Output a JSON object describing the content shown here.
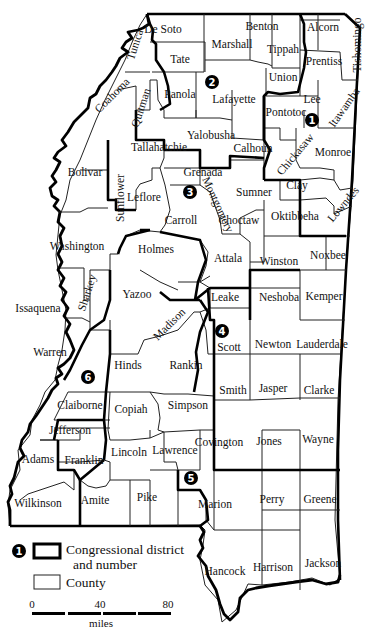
{
  "map": {
    "state": "Mississippi",
    "counties": [
      {
        "name": "De Soto",
        "x": 163,
        "y": 30
      },
      {
        "name": "Tunica",
        "x": 136,
        "y": 45,
        "rotate": -72
      },
      {
        "name": "Tate",
        "x": 180,
        "y": 60
      },
      {
        "name": "Marshall",
        "x": 232,
        "y": 45
      },
      {
        "name": "Benton",
        "x": 262,
        "y": 27
      },
      {
        "name": "Tippah",
        "x": 283,
        "y": 50
      },
      {
        "name": "Alcorn",
        "x": 323,
        "y": 28
      },
      {
        "name": "Tishomingo",
        "x": 358,
        "y": 45,
        "rotate": -90
      },
      {
        "name": "Prentiss",
        "x": 324,
        "y": 62
      },
      {
        "name": "Union",
        "x": 283,
        "y": 78
      },
      {
        "name": "Coahoma",
        "x": 113,
        "y": 96,
        "rotate": -45
      },
      {
        "name": "Quitman",
        "x": 142,
        "y": 108,
        "rotate": -72
      },
      {
        "name": "Panola",
        "x": 180,
        "y": 95
      },
      {
        "name": "Lafayette",
        "x": 234,
        "y": 100
      },
      {
        "name": "Pontotoc",
        "x": 286,
        "y": 113
      },
      {
        "name": "Lee",
        "x": 312,
        "y": 100
      },
      {
        "name": "Itawamba",
        "x": 345,
        "y": 108,
        "rotate": -55
      },
      {
        "name": "Tallahatchie",
        "x": 159,
        "y": 148
      },
      {
        "name": "Yalobusha",
        "x": 211,
        "y": 136
      },
      {
        "name": "Calhoun",
        "x": 253,
        "y": 149
      },
      {
        "name": "Chickasaw",
        "x": 296,
        "y": 155,
        "rotate": -50
      },
      {
        "name": "Monroe",
        "x": 333,
        "y": 153
      },
      {
        "name": "Bolivar",
        "x": 85,
        "y": 173
      },
      {
        "name": "Sunflower",
        "x": 121,
        "y": 198,
        "rotate": -90
      },
      {
        "name": "Leflore",
        "x": 144,
        "y": 198
      },
      {
        "name": "Grenada",
        "x": 203,
        "y": 173
      },
      {
        "name": "Carroll",
        "x": 181,
        "y": 221
      },
      {
        "name": "Montgomery",
        "x": 217,
        "y": 205,
        "rotate": 65
      },
      {
        "name": "Sumner",
        "x": 254,
        "y": 193
      },
      {
        "name": "Clay",
        "x": 297,
        "y": 186
      },
      {
        "name": "Choctaw",
        "x": 239,
        "y": 221
      },
      {
        "name": "Oktibbeha",
        "x": 295,
        "y": 217
      },
      {
        "name": "Lowndes",
        "x": 344,
        "y": 205,
        "rotate": -50
      },
      {
        "name": "Washington",
        "x": 77,
        "y": 247
      },
      {
        "name": "Holmes",
        "x": 156,
        "y": 250
      },
      {
        "name": "Attala",
        "x": 228,
        "y": 259
      },
      {
        "name": "Winston",
        "x": 279,
        "y": 262
      },
      {
        "name": "Noxbee",
        "x": 328,
        "y": 256
      },
      {
        "name": "Sharkey",
        "x": 88,
        "y": 293,
        "rotate": -72
      },
      {
        "name": "Yazoo",
        "x": 137,
        "y": 295
      },
      {
        "name": "Issaquena",
        "x": 38,
        "y": 309
      },
      {
        "name": "Madison",
        "x": 170,
        "y": 325,
        "rotate": -45
      },
      {
        "name": "Leake",
        "x": 225,
        "y": 298
      },
      {
        "name": "Neshoba",
        "x": 279,
        "y": 298
      },
      {
        "name": "Kemper",
        "x": 324,
        "y": 297
      },
      {
        "name": "Warren",
        "x": 50,
        "y": 353
      },
      {
        "name": "Scott",
        "x": 229,
        "y": 348
      },
      {
        "name": "Newton",
        "x": 273,
        "y": 345
      },
      {
        "name": "Lauderdale",
        "x": 322,
        "y": 345
      },
      {
        "name": "Hinds",
        "x": 128,
        "y": 366
      },
      {
        "name": "Rankin",
        "x": 186,
        "y": 366
      },
      {
        "name": "Smith",
        "x": 233,
        "y": 391
      },
      {
        "name": "Jasper",
        "x": 273,
        "y": 389
      },
      {
        "name": "Clarke",
        "x": 319,
        "y": 391
      },
      {
        "name": "Claiborne",
        "x": 80,
        "y": 406
      },
      {
        "name": "Copiah",
        "x": 131,
        "y": 410
      },
      {
        "name": "Simpson",
        "x": 188,
        "y": 406
      },
      {
        "name": "Jefferson",
        "x": 70,
        "y": 431
      },
      {
        "name": "Lincoln",
        "x": 129,
        "y": 453
      },
      {
        "name": "Lawrence",
        "x": 175,
        "y": 451
      },
      {
        "name": "Covington",
        "x": 219,
        "y": 443
      },
      {
        "name": "Jones",
        "x": 269,
        "y": 442
      },
      {
        "name": "Wayne",
        "x": 318,
        "y": 440
      },
      {
        "name": "Adams",
        "x": 38,
        "y": 460
      },
      {
        "name": "Franklin",
        "x": 84,
        "y": 461
      },
      {
        "name": "Wilkinson",
        "x": 38,
        "y": 504
      },
      {
        "name": "Amite",
        "x": 95,
        "y": 501
      },
      {
        "name": "Pike",
        "x": 147,
        "y": 498
      },
      {
        "name": "Marion",
        "x": 215,
        "y": 505
      },
      {
        "name": "Perry",
        "x": 272,
        "y": 500
      },
      {
        "name": "Greene",
        "x": 320,
        "y": 500
      },
      {
        "name": "Hancock",
        "x": 225,
        "y": 572
      },
      {
        "name": "Harrison",
        "x": 273,
        "y": 568
      },
      {
        "name": "Jackson",
        "x": 323,
        "y": 564
      }
    ],
    "districts": [
      {
        "number": "1",
        "x": 312,
        "y": 120
      },
      {
        "number": "2",
        "x": 212,
        "y": 82
      },
      {
        "number": "3",
        "x": 190,
        "y": 192
      },
      {
        "number": "4",
        "x": 222,
        "y": 331
      },
      {
        "number": "5",
        "x": 191,
        "y": 478
      },
      {
        "number": "6",
        "x": 88,
        "y": 377
      }
    ]
  },
  "legend": {
    "district_number_sample": "1",
    "district_label_line1": "Congressional district",
    "district_label_line2": "and number",
    "county_label": "County"
  },
  "scale": {
    "ticks": [
      "0",
      "40",
      "80"
    ],
    "unit": "miles"
  },
  "colors": {
    "background": "#ffffff",
    "line": "#000000",
    "fill": "#ffffff"
  }
}
